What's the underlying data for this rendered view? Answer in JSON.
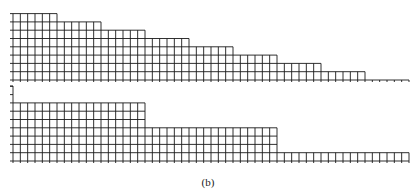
{
  "caption": "(b)",
  "chart_data": [
    {
      "type": "bar",
      "title": "",
      "description": "Staircase grid histogram, 54 unit columns in 9 groups of 6; each group one row shorter than the previous",
      "columns_per_group": 6,
      "group_heights": [
        8,
        7,
        6,
        5,
        4,
        3,
        2,
        1,
        0
      ],
      "ylim": [
        0,
        8
      ],
      "grid": true
    },
    {
      "type": "bar",
      "title": "",
      "description": "Grid histogram, 54 unit columns in 3 groups of 18",
      "columns_per_group": 18,
      "group_heights": [
        7,
        4,
        1
      ],
      "ylim": [
        0,
        10
      ],
      "grid": true
    }
  ],
  "layout": {
    "left": 13,
    "right": 409,
    "top_baseline": 80,
    "bottom_baseline": 161,
    "row_height": 8.3,
    "line_color": "#1a1a1a"
  }
}
